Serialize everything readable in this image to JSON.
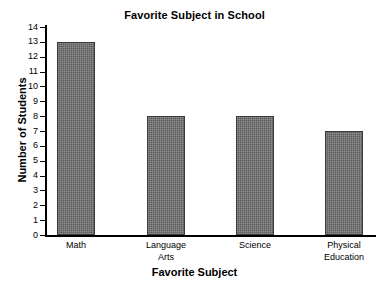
{
  "chart_data": {
    "type": "bar",
    "title": "Favorite Subject in School",
    "xlabel": "Favorite Subject",
    "ylabel": "Number of Students",
    "categories": [
      "Math",
      "Language\nArts",
      "Science",
      "Physical\nEducation"
    ],
    "values": [
      13,
      8,
      8,
      7
    ],
    "ylim": [
      0,
      14
    ],
    "ytick_labels": [
      "14",
      "13",
      "12",
      "11",
      "10",
      "9",
      "8",
      "7",
      "6",
      "5",
      "4",
      "3",
      "2",
      "1",
      "0"
    ],
    "ytick_values": [
      14,
      13,
      12,
      11,
      10,
      9,
      8,
      7,
      6,
      5,
      4,
      3,
      2,
      1,
      0
    ],
    "grid": false,
    "legend": false,
    "bar_color": "#5c5c5c",
    "bar_edge_color": "#3a3a3a",
    "axis_color": "#000000",
    "background_color": "#ffffff"
  }
}
